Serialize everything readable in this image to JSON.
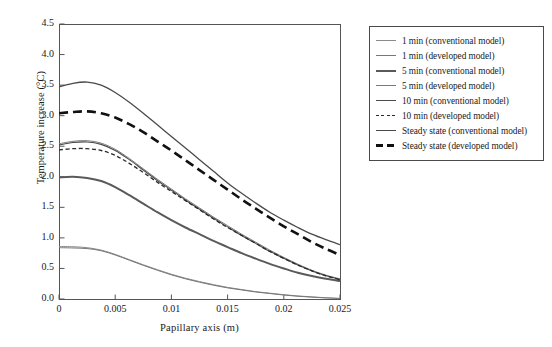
{
  "chart_data": {
    "type": "line",
    "title": "",
    "xlabel": "Papillary axis (m)",
    "ylabel": "Temperature increase (°C)",
    "xlim": [
      0,
      0.025
    ],
    "ylim": [
      0.0,
      4.5
    ],
    "xticks": [
      "0",
      "0.005",
      "0.01",
      "0.015",
      "0.02",
      "0.025"
    ],
    "xtick_values": [
      0,
      0.005,
      0.01,
      0.015,
      0.02,
      0.025
    ],
    "yticks": [
      "0.0",
      "0.5",
      "1.0",
      "1.5",
      "2.0",
      "2.5",
      "3.0",
      "3.5",
      "4.0",
      "4.5"
    ],
    "ytick_values": [
      0.0,
      0.5,
      1.0,
      1.5,
      2.0,
      2.5,
      3.0,
      3.5,
      4.0,
      4.5
    ],
    "grid": false,
    "legend_position": "right-outside",
    "x": [
      0,
      0.00125,
      0.0025,
      0.00375,
      0.005,
      0.00625,
      0.0075,
      0.00875,
      0.01,
      0.01125,
      0.0125,
      0.01375,
      0.015,
      0.01625,
      0.0175,
      0.01875,
      0.02,
      0.02125,
      0.0225,
      0.02375,
      0.025
    ],
    "series": [
      {
        "name": "1 min (conventional model)",
        "color": "#8a8a8a",
        "style": "solid",
        "width": 1.0,
        "values": [
          0.86,
          0.855,
          0.84,
          0.8,
          0.73,
          0.645,
          0.56,
          0.48,
          0.405,
          0.34,
          0.285,
          0.235,
          0.19,
          0.155,
          0.12,
          0.095,
          0.07,
          0.05,
          0.035,
          0.02,
          0.01
        ]
      },
      {
        "name": "1 min (developed model)",
        "color": "#777777",
        "style": "solid",
        "width": 1.0,
        "values": [
          0.84,
          0.835,
          0.825,
          0.79,
          0.72,
          0.635,
          0.55,
          0.47,
          0.395,
          0.33,
          0.275,
          0.225,
          0.182,
          0.148,
          0.115,
          0.09,
          0.065,
          0.045,
          0.03,
          0.018,
          0.008
        ]
      },
      {
        "name": "5 min (conventional model)",
        "color": "#5a5a5a",
        "style": "solid",
        "width": 2.0,
        "values": [
          1.99,
          2.0,
          1.98,
          1.93,
          1.83,
          1.7,
          1.56,
          1.42,
          1.29,
          1.17,
          1.06,
          0.95,
          0.85,
          0.75,
          0.66,
          0.575,
          0.5,
          0.43,
          0.375,
          0.33,
          0.295
        ]
      },
      {
        "name": "5 min (developed model)",
        "color": "#7a7a7a",
        "style": "solid",
        "width": 1.0,
        "values": [
          2.54,
          2.58,
          2.59,
          2.55,
          2.45,
          2.3,
          2.13,
          1.96,
          1.8,
          1.64,
          1.49,
          1.34,
          1.2,
          1.06,
          0.93,
          0.8,
          0.68,
          0.57,
          0.47,
          0.39,
          0.33
        ]
      },
      {
        "name": "10 min (conventional model)",
        "color": "#4a4a4a",
        "style": "solid",
        "width": 1.1,
        "values": [
          2.52,
          2.56,
          2.57,
          2.53,
          2.43,
          2.28,
          2.11,
          1.94,
          1.78,
          1.62,
          1.47,
          1.32,
          1.18,
          1.04,
          0.91,
          0.78,
          0.665,
          0.555,
          0.46,
          0.38,
          0.32
        ]
      },
      {
        "name": "10 min (developed model)",
        "color": "#2a2a2a",
        "style": "dashed-thin",
        "width": 1.3,
        "values": [
          2.44,
          2.46,
          2.46,
          2.43,
          2.35,
          2.22,
          2.07,
          1.91,
          1.76,
          1.61,
          1.46,
          1.31,
          1.17,
          1.04,
          0.91,
          0.78,
          0.665,
          0.555,
          0.46,
          0.38,
          0.315
        ]
      },
      {
        "name": "Steady state (conventional model)",
        "color": "#4a4a4a",
        "style": "solid",
        "width": 1.3,
        "values": [
          3.47,
          3.53,
          3.55,
          3.5,
          3.38,
          3.22,
          3.04,
          2.85,
          2.66,
          2.47,
          2.28,
          2.09,
          1.9,
          1.73,
          1.57,
          1.42,
          1.29,
          1.17,
          1.06,
          0.97,
          0.89
        ]
      },
      {
        "name": "Steady state (developed model)",
        "color": "#111111",
        "style": "dashed-thick",
        "width": 2.6,
        "values": [
          3.04,
          3.06,
          3.07,
          3.04,
          2.97,
          2.86,
          2.73,
          2.58,
          2.43,
          2.27,
          2.11,
          1.95,
          1.79,
          1.63,
          1.48,
          1.33,
          1.19,
          1.06,
          0.93,
          0.82,
          0.72
        ]
      }
    ]
  }
}
